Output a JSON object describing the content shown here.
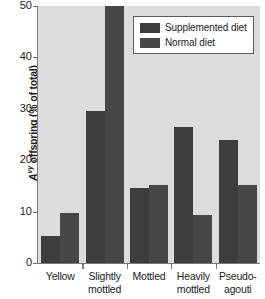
{
  "chart_data": {
    "type": "bar",
    "title": "",
    "xlabel": "",
    "ylabel": "Avy offspring (% of total)",
    "ylabel_parts": {
      "italic_base": "A",
      "superscript": "vy",
      "rest": " offspring (% of total)"
    },
    "categories": [
      "Yellow",
      "Slightly mottled",
      "Mottled",
      "Heavily mottled",
      "Pseudo-agouti"
    ],
    "category_lines": [
      [
        "Yellow"
      ],
      [
        "Slightly",
        "mottled"
      ],
      [
        "Mottled"
      ],
      [
        "Heavily",
        "mottled"
      ],
      [
        "Pseudo-",
        "agouti"
      ]
    ],
    "series": [
      {
        "name": "Supplemented diet",
        "color": "#3d3d3d",
        "values": [
          5.3,
          29.5,
          14.6,
          26.4,
          24.0
        ]
      },
      {
        "name": "Normal diet",
        "color": "#474747",
        "values": [
          9.8,
          50.0,
          15.2,
          9.4,
          15.2
        ]
      }
    ],
    "ylim": [
      0,
      50
    ],
    "yticks": [
      0,
      10,
      20,
      30,
      40,
      50
    ],
    "ytick_labels": [
      "0",
      "10",
      "20",
      "30",
      "40",
      "50"
    ],
    "grid": false,
    "legend_position": "top-right",
    "plot_background": "#dcdcdc",
    "axis_color": "#7a7a7a",
    "note": "Normal diet value for Slightly mottled reaches the axis maximum (50)"
  },
  "legend": {
    "entries": [
      {
        "label": "Supplemented diet",
        "swatch": "supplemented-swatch"
      },
      {
        "label": "Normal diet",
        "swatch": "normal-swatch"
      }
    ]
  }
}
